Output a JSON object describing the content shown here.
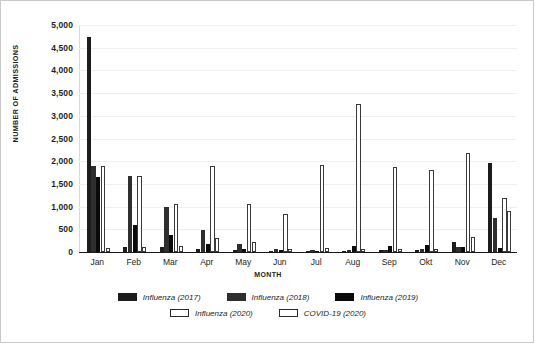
{
  "chart_data": {
    "type": "bar",
    "title": "",
    "subtitle": "",
    "xlabel": "MONTH",
    "ylabel": "NUMBER OF ADMISSIONS",
    "ylim": [
      0,
      5000
    ],
    "ytick_step": 500,
    "ytick_labels": [
      "5,000",
      "4,500",
      "4,000",
      "3,500",
      "3,000",
      "2,500",
      "2,000",
      "1,500",
      "1,000",
      "500",
      "0"
    ],
    "ytick_values": [
      5000,
      4500,
      4000,
      3500,
      3000,
      2500,
      2000,
      1500,
      1000,
      500,
      0
    ],
    "grid": true,
    "grid_axis": "y",
    "legend_position": "bottom",
    "categories": [
      "Jan",
      "Feb",
      "Mar",
      "Apr",
      "May",
      "Jun",
      "Jul",
      "Aug",
      "Sep",
      "Okt",
      "Nov",
      "Dec"
    ],
    "series": [
      {
        "name": "Influenza (2017)",
        "color": "#1c1c1c",
        "filled": true,
        "values": [
          4730,
          120,
          110,
          60,
          40,
          30,
          30,
          30,
          40,
          50,
          230,
          1950
        ]
      },
      {
        "name": "Influenza (2018)",
        "color": "#2e2e2e",
        "filled": true,
        "values": [
          1900,
          1680,
          1000,
          490,
          170,
          60,
          40,
          40,
          50,
          60,
          100,
          750
        ]
      },
      {
        "name": "Influenza (2019)",
        "color": "#0a0a0a",
        "filled": true,
        "values": [
          1650,
          600,
          370,
          180,
          60,
          40,
          30,
          140,
          140,
          150,
          100,
          80
        ]
      },
      {
        "name": "Influenza (2020)",
        "color": "#ffffff",
        "filled": false,
        "values": [
          1900,
          1680,
          1050,
          1900,
          1050,
          830,
          1920,
          3250,
          1880,
          1800,
          2180,
          1200
        ]
      },
      {
        "name": "COVID-19 (2020)",
        "color": "#ffffff",
        "filled": false,
        "values": [
          90,
          100,
          130,
          300,
          230,
          70,
          80,
          70,
          70,
          70,
          320,
          900
        ]
      }
    ]
  }
}
